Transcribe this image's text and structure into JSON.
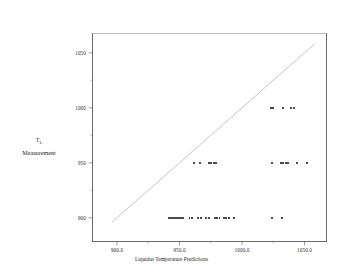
{
  "chart_data": {
    "type": "scatter",
    "title": "",
    "xlabel": "Liquidus Temperature Predictions",
    "ylabel": "T_L Measurement",
    "ylabel_main": "T",
    "ylabel_sub": "L",
    "ylabel_line2": "Measurement",
    "xlim": [
      880,
      1068
    ],
    "ylim": [
      878,
      1068
    ],
    "xticks": [
      900.0,
      950.0,
      1000.0,
      1050.0
    ],
    "xticklabels": [
      "900.0",
      "950.0",
      "1000.0",
      "1050.0"
    ],
    "xminorticks": [
      925.0,
      975.0,
      1025.0
    ],
    "yticks": [
      900,
      950,
      1000,
      1050
    ],
    "yticklabels": [
      "900",
      "950",
      "1000",
      "1050"
    ],
    "yminorticks": [
      925,
      975,
      1025
    ],
    "grid": false,
    "legend": null,
    "reference_line": {
      "name": "y = x identity line",
      "x0": 896.0,
      "y0": 896.0,
      "x1": 1058.0,
      "y1": 1058.0,
      "color": "#9a9a9a",
      "width": 0.6
    },
    "marker": {
      "shape": "dot",
      "color": "#111111",
      "size": 1.9
    },
    "series": [
      {
        "name": "observations",
        "points": [
          [
            941.5,
            900
          ],
          [
            943.5,
            900
          ],
          [
            945.0,
            900
          ],
          [
            946.5,
            900
          ],
          [
            948.0,
            900
          ],
          [
            949.5,
            900
          ],
          [
            951.0,
            900
          ],
          [
            952.5,
            900
          ],
          [
            958.0,
            900
          ],
          [
            960.0,
            900
          ],
          [
            965.0,
            900
          ],
          [
            967.5,
            900
          ],
          [
            971.5,
            900
          ],
          [
            973.5,
            900
          ],
          [
            978.5,
            900
          ],
          [
            980.0,
            900
          ],
          [
            982.0,
            900
          ],
          [
            985.5,
            900
          ],
          [
            987.5,
            900
          ],
          [
            989.5,
            900
          ],
          [
            993.5,
            900
          ],
          [
            1024.0,
            900
          ],
          [
            1032.0,
            900
          ],
          [
            961.5,
            950
          ],
          [
            966.5,
            950
          ],
          [
            973.5,
            950
          ],
          [
            975.5,
            950
          ],
          [
            977.5,
            950
          ],
          [
            979.5,
            950
          ],
          [
            1024.0,
            950
          ],
          [
            1031.0,
            950
          ],
          [
            1033.0,
            950
          ],
          [
            1035.0,
            950
          ],
          [
            1037.0,
            950
          ],
          [
            1044.0,
            950
          ],
          [
            1052.0,
            950
          ],
          [
            1023.5,
            1000
          ],
          [
            1025.0,
            1000
          ],
          [
            1033.0,
            1000
          ],
          [
            1039.5,
            1000
          ],
          [
            1041.5,
            1000
          ]
        ]
      }
    ]
  }
}
